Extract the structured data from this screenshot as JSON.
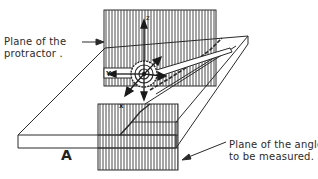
{
  "diagram": {
    "labels": {
      "protractor_plane_line1": "Plane of the",
      "protractor_plane_line2": "protractor .",
      "angle_plane_line1": "Plane of the angle",
      "angle_plane_line2": "to be measured.",
      "figure_letter": "A"
    },
    "axes": {
      "z": "z",
      "y": "Y",
      "x": "x"
    },
    "colors": {
      "line": "#2a2a2a",
      "hatch": "#555555",
      "background": "#ffffff"
    }
  }
}
